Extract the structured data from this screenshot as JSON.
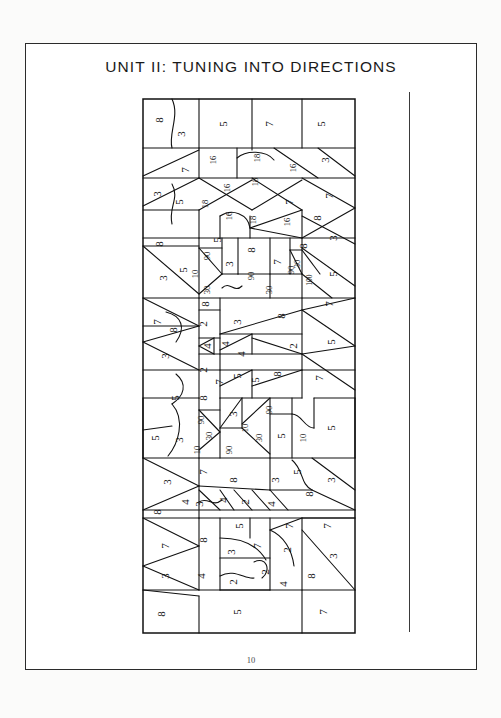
{
  "document": {
    "title": "UNIT II: TUNING INTO DIRECTIONS",
    "page_number": "10",
    "type": "worksheet-scan"
  },
  "puzzle": {
    "name": "color-by-number-geometric-puzzle",
    "box": {
      "x": 142,
      "y": 98,
      "width": 214,
      "height": 536
    },
    "numbers_used": [
      "2",
      "3",
      "4",
      "5",
      "7",
      "8",
      "10",
      "16",
      "18",
      "30",
      "90",
      "100"
    ],
    "orientation": "numbers rotated 90 degrees (sideways)",
    "cells": [
      {
        "label": "8",
        "x": 18,
        "y": 22
      },
      {
        "label": "3",
        "x": 40,
        "y": 36
      },
      {
        "label": "5",
        "x": 82,
        "y": 26
      },
      {
        "label": "7",
        "x": 128,
        "y": 26
      },
      {
        "label": "5",
        "x": 180,
        "y": 26
      },
      {
        "label": "16",
        "x": 72,
        "y": 62
      },
      {
        "label": "18",
        "x": 116,
        "y": 60
      },
      {
        "label": "16",
        "x": 152,
        "y": 70
      },
      {
        "label": "3",
        "x": 184,
        "y": 62
      },
      {
        "label": "7",
        "x": 44,
        "y": 72
      },
      {
        "label": "3",
        "x": 16,
        "y": 96
      },
      {
        "label": "5",
        "x": 38,
        "y": 104
      },
      {
        "label": "18",
        "x": 64,
        "y": 106
      },
      {
        "label": "16",
        "x": 86,
        "y": 90
      },
      {
        "label": "18",
        "x": 114,
        "y": 84
      },
      {
        "label": "7",
        "x": 148,
        "y": 104
      },
      {
        "label": "7",
        "x": 188,
        "y": 98
      },
      {
        "label": "16",
        "x": 88,
        "y": 118
      },
      {
        "label": "18",
        "x": 112,
        "y": 122
      },
      {
        "label": "16",
        "x": 146,
        "y": 124
      },
      {
        "label": "8",
        "x": 176,
        "y": 120
      },
      {
        "label": "3",
        "x": 192,
        "y": 140
      },
      {
        "label": "8",
        "x": 18,
        "y": 146
      },
      {
        "label": "5",
        "x": 76,
        "y": 142
      },
      {
        "label": "90",
        "x": 66,
        "y": 158
      },
      {
        "label": "8",
        "x": 110,
        "y": 152
      },
      {
        "label": "8",
        "x": 162,
        "y": 148
      },
      {
        "label": "30",
        "x": 156,
        "y": 166
      },
      {
        "label": "3",
        "x": 22,
        "y": 180
      },
      {
        "label": "5",
        "x": 42,
        "y": 172
      },
      {
        "label": "10",
        "x": 54,
        "y": 176
      },
      {
        "label": "3",
        "x": 88,
        "y": 166
      },
      {
        "label": "90",
        "x": 110,
        "y": 178
      },
      {
        "label": "7",
        "x": 136,
        "y": 164
      },
      {
        "label": "90",
        "x": 150,
        "y": 172
      },
      {
        "label": "100",
        "x": 168,
        "y": 182
      },
      {
        "label": "5",
        "x": 192,
        "y": 176
      },
      {
        "label": "30",
        "x": 66,
        "y": 192
      },
      {
        "label": "30",
        "x": 128,
        "y": 192
      },
      {
        "label": "7",
        "x": 188,
        "y": 206
      },
      {
        "label": "7",
        "x": 16,
        "y": 224
      },
      {
        "label": "8",
        "x": 32,
        "y": 232
      },
      {
        "label": "8",
        "x": 64,
        "y": 206
      },
      {
        "label": "2",
        "x": 62,
        "y": 226
      },
      {
        "label": "3",
        "x": 96,
        "y": 224
      },
      {
        "label": "8",
        "x": 140,
        "y": 218
      },
      {
        "label": "3",
        "x": 24,
        "y": 258
      },
      {
        "label": "4",
        "x": 66,
        "y": 248
      },
      {
        "label": "4",
        "x": 84,
        "y": 246
      },
      {
        "label": "4",
        "x": 100,
        "y": 256
      },
      {
        "label": "2",
        "x": 152,
        "y": 248
      },
      {
        "label": "5",
        "x": 190,
        "y": 244
      },
      {
        "label": "2",
        "x": 62,
        "y": 272
      },
      {
        "label": "7",
        "x": 78,
        "y": 284
      },
      {
        "label": "5",
        "x": 96,
        "y": 278
      },
      {
        "label": "5",
        "x": 114,
        "y": 282
      },
      {
        "label": "8",
        "x": 136,
        "y": 276
      },
      {
        "label": "7",
        "x": 178,
        "y": 280
      },
      {
        "label": "5",
        "x": 34,
        "y": 300
      },
      {
        "label": "8",
        "x": 62,
        "y": 300
      },
      {
        "label": "90",
        "x": 60,
        "y": 322
      },
      {
        "label": "3",
        "x": 92,
        "y": 316
      },
      {
        "label": "90",
        "x": 128,
        "y": 312
      },
      {
        "label": "30",
        "x": 68,
        "y": 338
      },
      {
        "label": "10",
        "x": 104,
        "y": 330
      },
      {
        "label": "30",
        "x": 118,
        "y": 340
      },
      {
        "label": "5",
        "x": 140,
        "y": 338
      },
      {
        "label": "10",
        "x": 162,
        "y": 340
      },
      {
        "label": "5",
        "x": 190,
        "y": 330
      },
      {
        "label": "5",
        "x": 14,
        "y": 340
      },
      {
        "label": "3",
        "x": 38,
        "y": 342
      },
      {
        "label": "10",
        "x": 56,
        "y": 352
      },
      {
        "label": "90",
        "x": 88,
        "y": 352
      },
      {
        "label": "3",
        "x": 26,
        "y": 384
      },
      {
        "label": "7",
        "x": 62,
        "y": 374
      },
      {
        "label": "8",
        "x": 92,
        "y": 382
      },
      {
        "label": "3",
        "x": 134,
        "y": 382
      },
      {
        "label": "5",
        "x": 156,
        "y": 374
      },
      {
        "label": "3",
        "x": 190,
        "y": 382
      },
      {
        "label": "8",
        "x": 16,
        "y": 414
      },
      {
        "label": "4",
        "x": 44,
        "y": 404
      },
      {
        "label": "3",
        "x": 58,
        "y": 406
      },
      {
        "label": "4",
        "x": 82,
        "y": 402
      },
      {
        "label": "2",
        "x": 104,
        "y": 404
      },
      {
        "label": "4",
        "x": 130,
        "y": 406
      },
      {
        "label": "8",
        "x": 168,
        "y": 396
      },
      {
        "label": "7",
        "x": 24,
        "y": 448
      },
      {
        "label": "8",
        "x": 62,
        "y": 442
      },
      {
        "label": "5",
        "x": 98,
        "y": 428
      },
      {
        "label": "7",
        "x": 148,
        "y": 428
      },
      {
        "label": "7",
        "x": 186,
        "y": 428
      },
      {
        "label": "3",
        "x": 90,
        "y": 454
      },
      {
        "label": "7",
        "x": 116,
        "y": 448
      },
      {
        "label": "2",
        "x": 146,
        "y": 452
      },
      {
        "label": "3",
        "x": 192,
        "y": 458
      },
      {
        "label": "3",
        "x": 24,
        "y": 478
      },
      {
        "label": "4",
        "x": 60,
        "y": 478
      },
      {
        "label": "2",
        "x": 92,
        "y": 484
      },
      {
        "label": "2",
        "x": 124,
        "y": 474
      },
      {
        "label": "4",
        "x": 142,
        "y": 486
      },
      {
        "label": "8",
        "x": 170,
        "y": 478
      },
      {
        "label": "8",
        "x": 20,
        "y": 516
      },
      {
        "label": "5",
        "x": 96,
        "y": 514
      },
      {
        "label": "7",
        "x": 182,
        "y": 514
      }
    ]
  }
}
